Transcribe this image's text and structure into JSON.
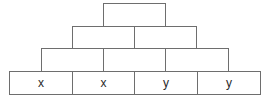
{
  "diagram": {
    "type": "number-pyramid",
    "border_color": "#6e6e6e",
    "rows": [
      {
        "level": "top",
        "cells": [
          ""
        ]
      },
      {
        "level": "second",
        "cells": [
          "",
          ""
        ]
      },
      {
        "level": "third",
        "cells": [
          "",
          "",
          ""
        ]
      },
      {
        "level": "base",
        "cells": [
          "x",
          "x",
          "y",
          "y"
        ]
      }
    ]
  }
}
